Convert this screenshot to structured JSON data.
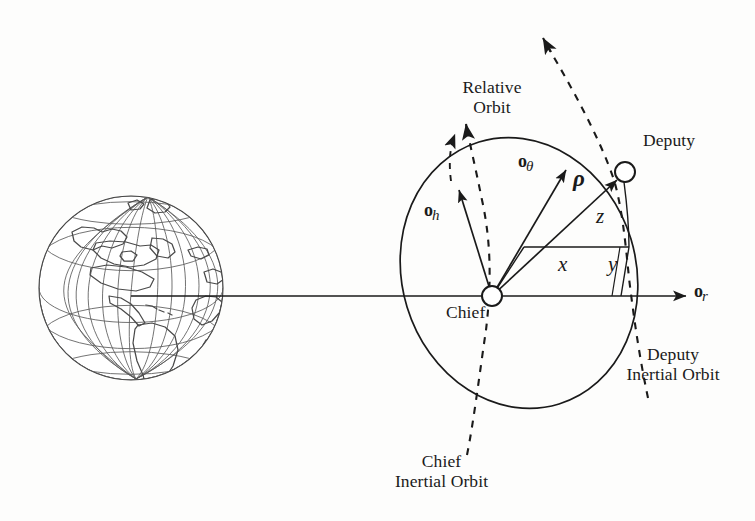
{
  "figure": {
    "background_color": "#fdfdfc",
    "ink_color": "#1a1a1a"
  },
  "labels": {
    "relative_orbit": "Relative\nOrbit",
    "deputy": "Deputy",
    "chief": "Chief",
    "deputy_inertial_orbit": "Deputy\nInertial Orbit",
    "chief_inertial_orbit": "Chief\nInertial Orbit"
  },
  "vectors": {
    "o_h": {
      "base": "o",
      "subscript": "h"
    },
    "o_theta": {
      "base": "o",
      "subscript": "θ"
    },
    "o_r": {
      "base": "o",
      "subscript": "r"
    },
    "rho": "ρ"
  },
  "components": {
    "x": "x",
    "y": "y",
    "z": "z"
  },
  "nodes": [
    {
      "name": "chief",
      "label": "Chief",
      "cx": 492,
      "cy": 296,
      "r": 10
    },
    {
      "name": "deputy",
      "label": "Deputy",
      "cx": 625,
      "cy": 172,
      "r": 10
    }
  ],
  "earth": {
    "name": "earth-globe",
    "cx": 131,
    "cy": 288,
    "r": 92,
    "graticule_meridians": 12,
    "graticule_parallels": 7
  }
}
